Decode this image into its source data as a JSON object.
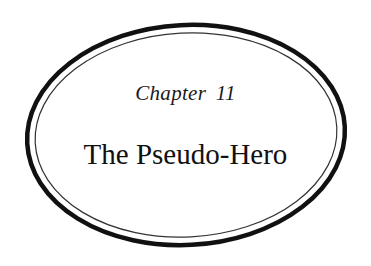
{
  "chapter_heading": {
    "label": "Chapter 11",
    "title": "The Pseudo-Hero"
  },
  "colors": {
    "background": "#ffffff",
    "ink": "#111111"
  }
}
